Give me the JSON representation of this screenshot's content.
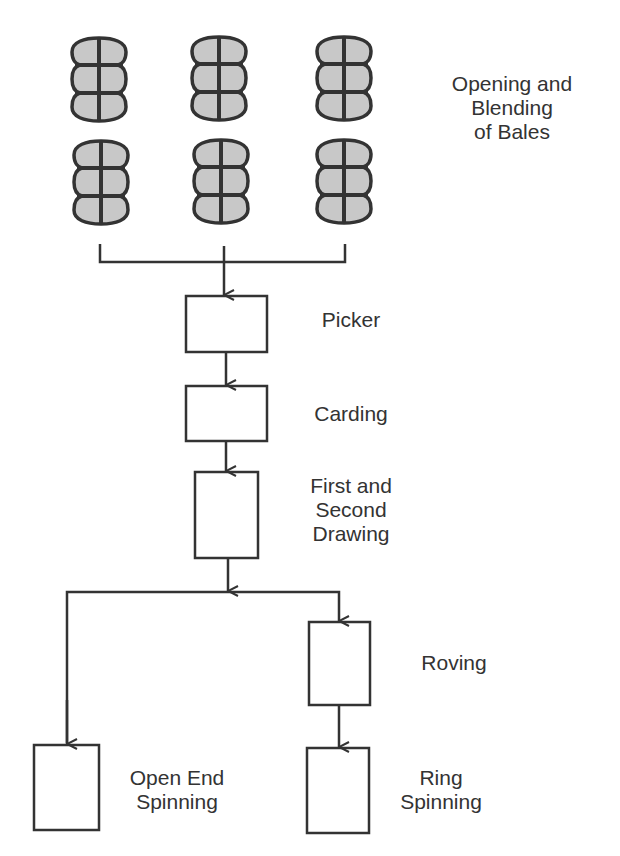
{
  "diagram": {
    "colors": {
      "stroke": "#333333",
      "bale_fill": "#c8c8c8",
      "background": "#ffffff"
    },
    "bales": {
      "icon": "cotton-bale-icon",
      "count": 6,
      "label_lines": [
        "Opening and",
        "Blending",
        "of Bales"
      ]
    },
    "steps": [
      {
        "id": "picker",
        "label_lines": [
          "Picker"
        ]
      },
      {
        "id": "carding",
        "label_lines": [
          "Carding"
        ]
      },
      {
        "id": "drawing",
        "label_lines": [
          "First and",
          "Second",
          "Drawing"
        ]
      },
      {
        "id": "roving",
        "label_lines": [
          "Roving"
        ]
      },
      {
        "id": "open-end-spinning",
        "label_lines": [
          "Open End",
          "Spinning"
        ]
      },
      {
        "id": "ring-spinning",
        "label_lines": [
          "Ring",
          "Spinning"
        ]
      }
    ],
    "edges": [
      [
        "bales",
        "picker"
      ],
      [
        "picker",
        "carding"
      ],
      [
        "carding",
        "drawing"
      ],
      [
        "drawing",
        "open-end-spinning"
      ],
      [
        "drawing",
        "roving"
      ],
      [
        "roving",
        "ring-spinning"
      ]
    ]
  }
}
